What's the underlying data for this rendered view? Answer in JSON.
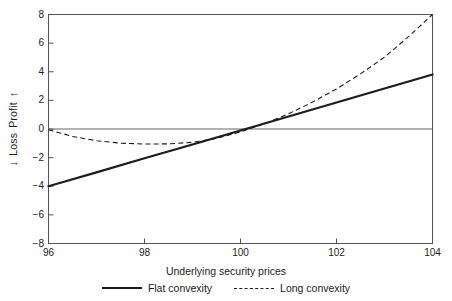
{
  "chart_data": {
    "type": "line",
    "title": "",
    "xlabel": "Underlying security prices",
    "ylabel": "↓ Loss   Profit ↑",
    "ylabel_parts": {
      "down_arrow": "↓",
      "loss": "Loss",
      "profit": "Profit",
      "up_arrow": "↑"
    },
    "xlim": [
      96,
      104
    ],
    "ylim": [
      -8,
      8
    ],
    "xticks": [
      96,
      98,
      100,
      102,
      104
    ],
    "xticklabels": [
      "96",
      "98",
      "100",
      "102",
      "104"
    ],
    "yticks": [
      -8,
      -6,
      -4,
      -2,
      0,
      2,
      4,
      6,
      8
    ],
    "yticklabels": [
      "-8",
      "-6",
      "-4",
      "-2",
      "0",
      "2",
      "4",
      "6",
      "8"
    ],
    "grid": false,
    "zero_line": 0,
    "legend_position": "below",
    "series": [
      {
        "name": "Flat convexity",
        "style": "solid",
        "color": "#1b1b1b",
        "x": [
          96,
          97,
          98,
          99,
          100,
          101,
          102,
          103,
          104
        ],
        "values": [
          -4.0,
          -3.03,
          -2.05,
          -1.08,
          -0.1,
          0.88,
          1.85,
          2.83,
          3.8
        ]
      },
      {
        "name": "Long convexity",
        "style": "dashed",
        "color": "#1b1b1b",
        "x": [
          96,
          96.5,
          97,
          97.5,
          98,
          98.5,
          99,
          99.5,
          100,
          100.5,
          101,
          101.5,
          102,
          102.5,
          103,
          103.5,
          104
        ],
        "values": [
          -0.05,
          -0.52,
          -0.82,
          -0.99,
          -1.05,
          -1.04,
          -0.93,
          -0.66,
          -0.2,
          0.37,
          1.06,
          1.88,
          2.8,
          3.85,
          5.02,
          6.45,
          8.0
        ]
      }
    ]
  },
  "legend": {
    "items": [
      {
        "label": "Flat convexity",
        "style": "solid"
      },
      {
        "label": "Long convexity",
        "style": "dashed"
      }
    ]
  },
  "axes": {
    "x_title": "Underlying security prices",
    "y_title_loss": "Loss",
    "y_title_profit": "Profit"
  },
  "colors": {
    "ink": "#1b1b1b",
    "frame": "#555555",
    "background": "#ffffff"
  }
}
